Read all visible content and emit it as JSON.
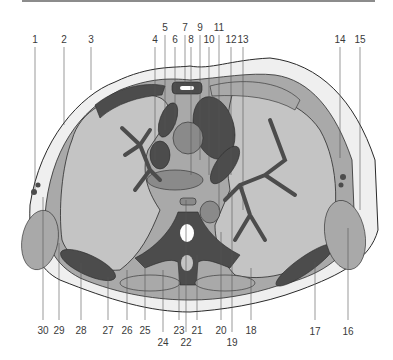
{
  "figure": {
    "title": "",
    "colors": {
      "background": "#ffffff",
      "skin_fat": "#efefef",
      "muscle": "#a9a9a9",
      "lung_liver": "#c4c4c4",
      "dark_structures": "#4c4c4c",
      "medium_structures": "#8a8a8a",
      "outline": "#2a2a2a",
      "label_text": "#3a3a3a"
    },
    "top_labels": [
      {
        "id": "1",
        "text": "1",
        "x": 35,
        "y": 35
      },
      {
        "id": "2",
        "text": "2",
        "x": 64,
        "y": 35
      },
      {
        "id": "3",
        "text": "3",
        "x": 91,
        "y": 35
      },
      {
        "id": "4",
        "text": "4",
        "x": 155,
        "y": 35
      },
      {
        "id": "5",
        "text": "5",
        "x": 165,
        "y": 23
      },
      {
        "id": "6",
        "text": "6",
        "x": 175,
        "y": 35
      },
      {
        "id": "7",
        "text": "7",
        "x": 185,
        "y": 23
      },
      {
        "id": "8",
        "text": "8",
        "x": 191,
        "y": 35
      },
      {
        "id": "9",
        "text": "9",
        "x": 200,
        "y": 23
      },
      {
        "id": "10",
        "text": "10",
        "x": 209,
        "y": 35
      },
      {
        "id": "11",
        "text": "11",
        "x": 219,
        "y": 23
      },
      {
        "id": "12",
        "text": "12",
        "x": 231,
        "y": 35
      },
      {
        "id": "13",
        "text": "13",
        "x": 243,
        "y": 35
      },
      {
        "id": "14",
        "text": "14",
        "x": 340,
        "y": 35
      },
      {
        "id": "15",
        "text": "15",
        "x": 360,
        "y": 35
      }
    ],
    "bottom_labels": [
      {
        "id": "30",
        "text": "30",
        "x": 43,
        "y": 326
      },
      {
        "id": "29",
        "text": "29",
        "x": 59,
        "y": 326
      },
      {
        "id": "28",
        "text": "28",
        "x": 81,
        "y": 326
      },
      {
        "id": "27",
        "text": "27",
        "x": 108,
        "y": 326
      },
      {
        "id": "26",
        "text": "26",
        "x": 127,
        "y": 326
      },
      {
        "id": "25",
        "text": "25",
        "x": 145,
        "y": 326
      },
      {
        "id": "24",
        "text": "24",
        "x": 163,
        "y": 338
      },
      {
        "id": "23",
        "text": "23",
        "x": 179,
        "y": 326
      },
      {
        "id": "22",
        "text": "22",
        "x": 186,
        "y": 338
      },
      {
        "id": "21",
        "text": "21",
        "x": 197,
        "y": 326
      },
      {
        "id": "20",
        "text": "20",
        "x": 221,
        "y": 326
      },
      {
        "id": "19",
        "text": "19",
        "x": 232,
        "y": 338
      },
      {
        "id": "18",
        "text": "18",
        "x": 251,
        "y": 326
      },
      {
        "id": "17",
        "text": "17",
        "x": 315,
        "y": 327
      },
      {
        "id": "16",
        "text": "16",
        "x": 348,
        "y": 327
      }
    ],
    "leader_lines": [
      {
        "id": "1",
        "x": 35,
        "y1": 47,
        "y2": 190
      },
      {
        "id": "2",
        "x": 64,
        "y1": 47,
        "y2": 125
      },
      {
        "id": "3",
        "x": 91,
        "y1": 47,
        "y2": 90
      },
      {
        "id": "4",
        "x": 155,
        "y1": 47,
        "y2": 160
      },
      {
        "id": "5",
        "x": 165,
        "y1": 35,
        "y2": 130
      },
      {
        "id": "6",
        "x": 175,
        "y1": 47,
        "y2": 125
      },
      {
        "id": "7",
        "x": 185,
        "y1": 35,
        "y2": 85
      },
      {
        "id": "8",
        "x": 191,
        "y1": 47,
        "y2": 175
      },
      {
        "id": "9",
        "x": 200,
        "y1": 35,
        "y2": 160
      },
      {
        "id": "10",
        "x": 209,
        "y1": 47,
        "y2": 175
      },
      {
        "id": "11",
        "x": 219,
        "y1": 35,
        "y2": 210
      },
      {
        "id": "12",
        "x": 231,
        "y1": 47,
        "y2": 175
      },
      {
        "id": "13",
        "x": 243,
        "y1": 47,
        "y2": 210
      },
      {
        "id": "14",
        "x": 340,
        "y1": 47,
        "y2": 158
      },
      {
        "id": "15",
        "x": 360,
        "y1": 47,
        "y2": 210
      },
      {
        "id": "30",
        "x": 43,
        "y1": 197,
        "y2": 320
      },
      {
        "id": "29",
        "x": 59,
        "y1": 243,
        "y2": 320
      },
      {
        "id": "28",
        "x": 81,
        "y1": 263,
        "y2": 320
      },
      {
        "id": "27",
        "x": 108,
        "y1": 277,
        "y2": 320
      },
      {
        "id": "26",
        "x": 127,
        "y1": 270,
        "y2": 320
      },
      {
        "id": "25",
        "x": 145,
        "y1": 265,
        "y2": 320
      },
      {
        "id": "24",
        "x": 163,
        "y1": 270,
        "y2": 332
      },
      {
        "id": "23",
        "x": 179,
        "y1": 260,
        "y2": 320
      },
      {
        "id": "22",
        "x": 186,
        "y1": 200,
        "y2": 332
      },
      {
        "id": "21",
        "x": 197,
        "y1": 255,
        "y2": 320
      },
      {
        "id": "20",
        "x": 221,
        "y1": 232,
        "y2": 320
      },
      {
        "id": "19",
        "x": 232,
        "y1": 190,
        "y2": 332
      },
      {
        "id": "18",
        "x": 251,
        "y1": 268,
        "y2": 320
      },
      {
        "id": "17",
        "x": 315,
        "y1": 262,
        "y2": 320
      },
      {
        "id": "16",
        "x": 348,
        "y1": 228,
        "y2": 320
      }
    ]
  }
}
